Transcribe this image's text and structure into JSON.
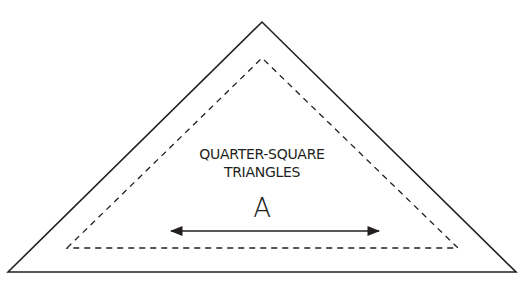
{
  "diagram": {
    "type": "quilt-template",
    "title_line1": "QUARTER-SQUARE",
    "title_line2": "TRIANGLES",
    "piece_label": "A",
    "colors": {
      "background": "#ffffff",
      "stroke": "#231f20"
    },
    "outer_triangle": {
      "description": "cutting line (finished size + seam allowance)",
      "points": [
        [
          8,
          272
        ],
        [
          262,
          22
        ],
        [
          516,
          272
        ]
      ]
    },
    "inner_triangle": {
      "description": "sewing line (dashed)",
      "points": [
        [
          67,
          248
        ],
        [
          262,
          58
        ],
        [
          458,
          248
        ]
      ]
    },
    "grain_arrow": {
      "description": "double-headed grainline arrow",
      "x1": 169,
      "x2": 381,
      "y": 231
    }
  }
}
